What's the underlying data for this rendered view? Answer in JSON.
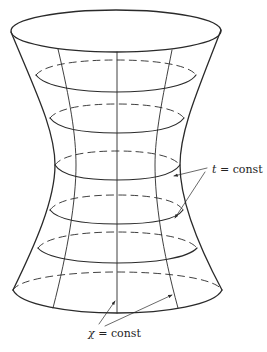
{
  "figure": {
    "stroke_color": "#2a2a2a",
    "background": "#ffffff"
  },
  "labels": {
    "t_label_var": "t",
    "t_label_rest": " = const",
    "chi_label_var": "χ",
    "chi_label_rest": " = const"
  }
}
